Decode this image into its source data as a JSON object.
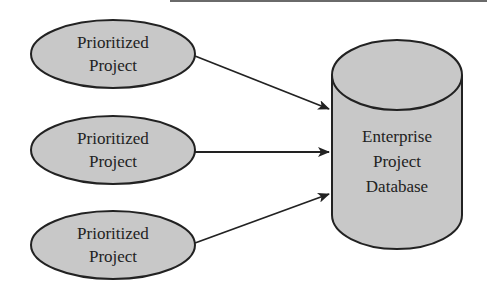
{
  "diagram": {
    "sources": [
      {
        "line1": "Prioritized",
        "line2": "Project"
      },
      {
        "line1": "Prioritized",
        "line2": "Project"
      },
      {
        "line1": "Prioritized",
        "line2": "Project"
      }
    ],
    "target": {
      "line1": "Enterprise",
      "line2": "Project",
      "line3": "Database"
    },
    "colors": {
      "fill": "#c8c8c8",
      "stroke": "#222222",
      "arrow": "#222222"
    }
  }
}
